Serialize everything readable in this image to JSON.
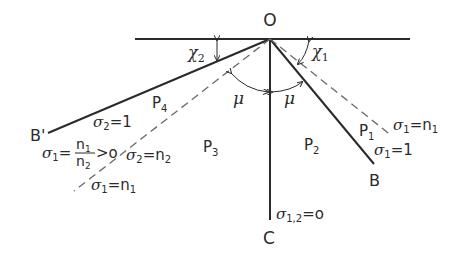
{
  "diagram": {
    "type": "wave-interaction-geometry",
    "points": {
      "origin": "O",
      "right_end": "B",
      "left_end": "B'",
      "bottom_end": "C"
    },
    "angles": {
      "chi1": "χ",
      "chi1_sub": "1",
      "chi2": "χ",
      "chi2_sub": "2",
      "mu_left": "μ",
      "mu_right": "μ"
    },
    "regions": {
      "p1": "P",
      "p1_sub": "1",
      "p2": "P",
      "p2_sub": "2",
      "p3": "P",
      "p3_sub": "3",
      "p4": "P",
      "p4_sub": "4"
    },
    "labels": {
      "sigma": "σ",
      "right_dashed_sub": "1",
      "right_dashed_val": "=n",
      "right_dashed_val_sub": "1",
      "right_solid_sub": "1",
      "right_solid_val": "=1",
      "left_solid_sub": "2",
      "left_solid_val": "=1",
      "left_frac_sub": "1",
      "left_frac_eq": "=",
      "left_frac_num": "n",
      "left_frac_num_sub": "1",
      "left_frac_den": "n",
      "left_frac_den_sub": "2",
      "left_frac_tail": ">o",
      "left_mid_sub": "2",
      "left_mid_val": "=n",
      "left_mid_val_sub": "2",
      "left_dashed_sub": "1",
      "left_dashed_val": "=n",
      "left_dashed_val_sub": "1",
      "bottom_sub": "1,2",
      "bottom_val": "=o"
    },
    "colors": {
      "line": "#2a2a2a",
      "dashed": "#6a6a6a",
      "background": "#ffffff"
    }
  }
}
